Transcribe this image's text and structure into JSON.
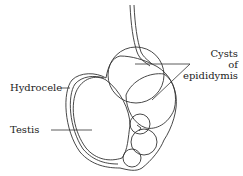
{
  "diagram": {
    "type": "anatomical illustration",
    "labels": {
      "cysts_line1": "Cysts",
      "cysts_line2": "of",
      "cysts_line3": "epididymis",
      "hydrocele": "Hydrocele",
      "testis": "Testis"
    },
    "colors": {
      "stroke": "#333333",
      "text": "#222222",
      "background": "#ffffff"
    }
  }
}
